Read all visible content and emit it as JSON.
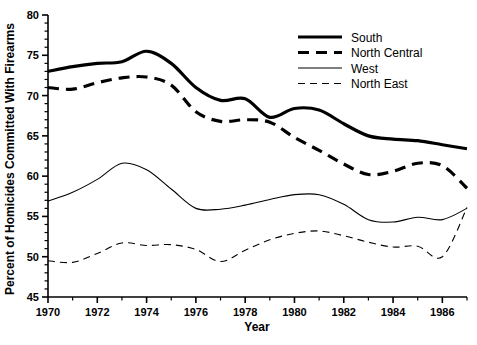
{
  "chart_data": {
    "type": "line",
    "title": "",
    "xlabel": "Year",
    "ylabel": "Percent of Homicides Committed With Firearms",
    "xlim": [
      1970,
      1987
    ],
    "ylim": [
      45,
      80
    ],
    "ytick_labels": [
      "45",
      "50",
      "55",
      "60",
      "65",
      "70",
      "75",
      "80"
    ],
    "ytick_values": [
      45,
      50,
      55,
      60,
      65,
      70,
      75,
      80
    ],
    "ytick_minor_step": 1,
    "xtick_labels": [
      "1970",
      "1972",
      "1974",
      "1976",
      "1978",
      "1980",
      "1982",
      "1984",
      "1986"
    ],
    "xtick_values": [
      1970,
      1972,
      1974,
      1976,
      1978,
      1980,
      1982,
      1984,
      1986
    ],
    "grid": false,
    "legend_position": "top-right",
    "x": [
      1970,
      1971,
      1972,
      1973,
      1974,
      1975,
      1976,
      1977,
      1978,
      1979,
      1980,
      1981,
      1982,
      1983,
      1984,
      1985,
      1986,
      1987
    ],
    "series": [
      {
        "name": "South",
        "style": "thick-solid",
        "values": [
          73.0,
          73.6,
          74.0,
          74.2,
          75.5,
          74.0,
          71.0,
          69.4,
          69.6,
          67.3,
          68.4,
          68.2,
          66.5,
          65.0,
          64.6,
          64.4,
          63.9,
          63.4
        ]
      },
      {
        "name": "North Central",
        "style": "thick-dashed",
        "values": [
          71.0,
          70.8,
          71.6,
          72.2,
          72.3,
          71.3,
          68.0,
          66.8,
          67.0,
          66.7,
          64.8,
          63.2,
          61.5,
          60.2,
          60.6,
          61.6,
          61.3,
          58.5
        ]
      },
      {
        "name": "West",
        "style": "thin-solid",
        "values": [
          56.9,
          58.0,
          59.6,
          61.6,
          60.8,
          58.4,
          56.0,
          55.9,
          56.4,
          57.1,
          57.7,
          57.7,
          56.5,
          54.6,
          54.3,
          54.9,
          54.6,
          56.0
        ]
      },
      {
        "name": "North East",
        "style": "thin-dashed",
        "values": [
          49.5,
          49.3,
          50.4,
          51.7,
          51.4,
          51.5,
          50.9,
          49.4,
          50.8,
          52.1,
          52.9,
          53.2,
          52.6,
          51.8,
          51.2,
          51.3,
          50.0,
          56.1
        ]
      }
    ]
  },
  "legend": {
    "items": [
      {
        "label": "South",
        "style": "thick-solid"
      },
      {
        "label": "North Central",
        "style": "thick-dashed"
      },
      {
        "label": "West",
        "style": "thin-solid"
      },
      {
        "label": "North East",
        "style": "thin-dashed"
      }
    ]
  }
}
